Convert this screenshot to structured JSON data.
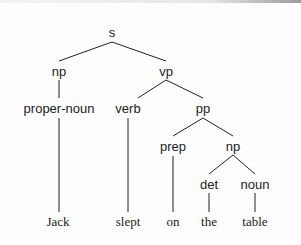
{
  "tree": {
    "nodes": {
      "s": "s",
      "np": "np",
      "vp": "vp",
      "proper_noun": "proper-noun",
      "verb": "verb",
      "pp": "pp",
      "prep": "prep",
      "np2": "np",
      "det": "det",
      "noun": "noun"
    },
    "leaves": {
      "jack": "Jack",
      "slept": "slept",
      "on": "on",
      "the": "the",
      "table": "table"
    },
    "sentence": "Jack slept on the table"
  }
}
